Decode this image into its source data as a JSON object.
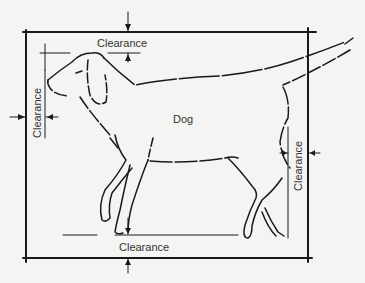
{
  "diagram": {
    "subject_label": "Dog",
    "clearances": {
      "top": "Clearance",
      "left": "Clearance",
      "right": "Clearance",
      "bottom": "Clearance"
    },
    "colors": {
      "background": "#f4f4f2",
      "line": "#1a1a1a",
      "text": "#333333"
    }
  }
}
